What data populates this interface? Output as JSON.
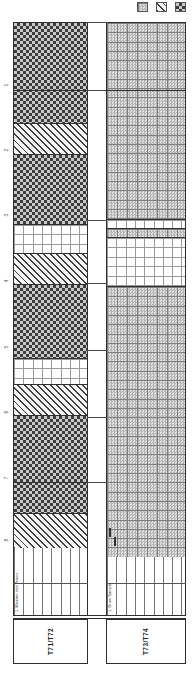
{
  "legend": {
    "items": [
      {
        "key": "fabric",
        "name": "fabric-pattern-swatch"
      },
      {
        "key": "hatch",
        "name": "diagonal-hatch-swatch"
      },
      {
        "key": "checker",
        "name": "checker-pattern-swatch"
      }
    ]
  },
  "depth_scale": {
    "ticks": [
      {
        "label": "1",
        "y": 85
      },
      {
        "label": "2",
        "y": 150
      },
      {
        "label": "3",
        "y": 215
      },
      {
        "label": "4",
        "y": 281
      },
      {
        "label": "5",
        "y": 347
      },
      {
        "label": "6",
        "y": 412
      },
      {
        "label": "7",
        "y": 478
      },
      {
        "label": "8",
        "y": 540
      }
    ]
  },
  "columns": {
    "left": {
      "label": "T71/T72",
      "note": "1. Monster met Tonen",
      "sections": [
        {
          "pattern": "checker",
          "h": 100
        },
        {
          "pattern": "hatch",
          "h": 31
        },
        {
          "pattern": "checker",
          "h": 70
        },
        {
          "pattern": "grid",
          "h": 29
        },
        {
          "pattern": "hatch",
          "h": 31
        },
        {
          "pattern": "checker",
          "h": 75
        },
        {
          "pattern": "grid",
          "h": 26
        },
        {
          "pattern": "hatch",
          "h": 31
        },
        {
          "pattern": "checker",
          "h": 98
        },
        {
          "pattern": "hatch",
          "h": 35
        }
      ]
    },
    "right": {
      "label": "T73/T74",
      "note": "1. Drum Sample",
      "sections": [
        {
          "pattern": "fabric",
          "h": 196
        },
        {
          "pattern": "grid",
          "h": 9
        },
        {
          "pattern": "fabric",
          "h": 9
        },
        {
          "pattern": "grid",
          "h": 49
        },
        {
          "pattern": "fabric",
          "h": 272
        }
      ]
    }
  },
  "correlation_lines_y": [
    90,
    220,
    283,
    350,
    417,
    482
  ],
  "extra_boundary_lines": [
    {
      "x": 13,
      "w": 74,
      "y": 90
    },
    {
      "x": 13,
      "w": 74,
      "y": 482
    },
    {
      "x": 106,
      "w": 80,
      "y": 90
    }
  ],
  "colors": {
    "ink": "#2f2f2f",
    "checker_dark": "#3d3d3d",
    "checker_light": "#c9c9c9",
    "fabric_base": "#d6d6d6",
    "grid_line": "#9a9a9a"
  }
}
